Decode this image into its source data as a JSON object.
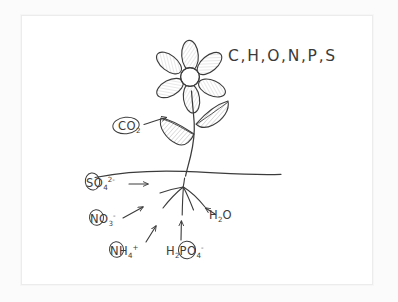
{
  "diagram": {
    "style": "hand-drawn pencil sketch",
    "colors": {
      "ink": "#3c3c3c",
      "paper": "#ffffff",
      "page_background": "#fbfbfb",
      "frame_border": "#ececec",
      "leaf_shading": "#d9d9d9",
      "petal_shading": "#dedede"
    }
  },
  "labels": {
    "atmosphere_elements": "C,H,O,N,P,S",
    "carbon_dioxide": {
      "formula": "CO",
      "sub": "2"
    },
    "sulfate": {
      "formula": "SO",
      "sub": "4",
      "sup": "2-"
    },
    "nitrate": {
      "formula": "NO",
      "sub": "3",
      "sup": "-"
    },
    "ammonium": {
      "formula": "NH",
      "sub": "4",
      "sup": "+"
    },
    "phosphate": {
      "pre": "H",
      "pre_sub": "2",
      "mid": "PO",
      "sub": "4",
      "sup": "-"
    },
    "water": {
      "formula": "H",
      "sub": "2",
      "post": "O"
    }
  },
  "parts": {
    "flower": "flower-head",
    "petal_count": 6,
    "leaf_count": 2,
    "stem": "stem",
    "soil_line": "soil-surface-line",
    "root_branch_count": 5
  },
  "arrows": [
    {
      "name": "co2-to-leaf",
      "from": "CO2 label",
      "to": "left leaf"
    },
    {
      "name": "sulfate-to-root",
      "from": "SO4 label",
      "to": "root zone"
    },
    {
      "name": "nitrate-to-root",
      "from": "NO3 label",
      "to": "root zone"
    },
    {
      "name": "ammonium-to-root",
      "from": "NH4 label",
      "to": "root zone"
    },
    {
      "name": "phosphate-to-root",
      "from": "H2PO4 label",
      "to": "root zone"
    },
    {
      "name": "water-to-root",
      "from": "H2O label",
      "to": "root zone"
    }
  ]
}
